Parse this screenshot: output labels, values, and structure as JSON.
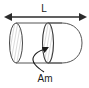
{
  "figure": {
    "name": "capsule-length-and-midsection-area-diagram",
    "background_color": "#ffffff",
    "stroke_color": "#3a3a3a",
    "hatch_color": "#b0b0b0",
    "label_color": "#1a1a1a",
    "dimension": {
      "label": "L",
      "label_name": "length-dimension-label",
      "arrow_name": "length-dimension-arrow",
      "x_start": 11,
      "x_end": 80,
      "y": 17
    },
    "callout": {
      "label": "Am",
      "label_name": "midsection-area-label",
      "leader_name": "midsection-area-leader-arrow",
      "target_x": 47,
      "target_y": 48,
      "label_x": 45,
      "label_y": 80
    },
    "body": {
      "name": "capsule-body",
      "left_ellipse": {
        "cx": 16,
        "cy": 43,
        "rx": 6.5,
        "ry": 20
      },
      "mid_ellipse": {
        "cx": 48,
        "cy": 43,
        "rx": 5.5,
        "ry": 20
      },
      "nose_tip_x": 82,
      "top_y": 23,
      "bottom_y": 63
    }
  }
}
